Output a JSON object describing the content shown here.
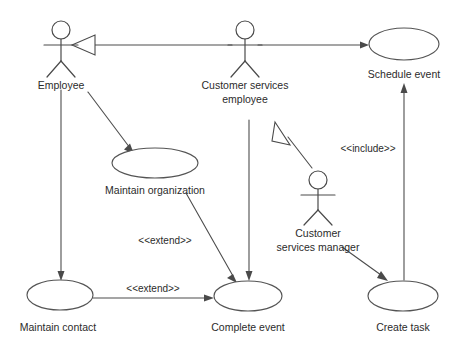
{
  "diagram": {
    "type": "uml-use-case-diagram",
    "background_color": "#ffffff",
    "line_color": "#4a4a4a",
    "text_color": "#2b2b2b",
    "actors": [
      {
        "id": "employee",
        "label": "Employee",
        "x": 61,
        "y": 45
      },
      {
        "id": "customer-services-employee",
        "label_line1": "Customer services",
        "label_line2": "employee",
        "x": 245,
        "y": 45
      },
      {
        "id": "customer-services-manager",
        "label_line1": "Customer",
        "label_line2": "services manager",
        "x": 318,
        "y": 195
      }
    ],
    "use_cases": [
      {
        "id": "schedule-event",
        "label": "Schedule event",
        "cx": 404,
        "cy": 44,
        "rx": 35,
        "ry": 16
      },
      {
        "id": "maintain-organization",
        "label": "Maintain organization",
        "cx": 155,
        "cy": 163,
        "rx": 43,
        "ry": 15
      },
      {
        "id": "maintain-contact",
        "label": "Maintain contact",
        "cx": 60,
        "cy": 295,
        "rx": 33,
        "ry": 15
      },
      {
        "id": "complete-event",
        "label": "Complete event",
        "cx": 248,
        "cy": 296,
        "rx": 34,
        "ry": 15
      },
      {
        "id": "create-task",
        "label": "Create task",
        "cx": 403,
        "cy": 296,
        "rx": 35,
        "ry": 15
      }
    ],
    "relationships": [
      {
        "id": "generalization-cse-to-employee",
        "kind": "generalization",
        "from": "customer-services-employee",
        "to": "employee",
        "label": ""
      },
      {
        "id": "generalization-manager-to-cse",
        "kind": "generalization",
        "from": "customer-services-manager",
        "to": "customer-services-employee",
        "label": ""
      },
      {
        "id": "assoc-cse-to-schedule-event",
        "kind": "association",
        "from": "customer-services-employee",
        "to": "schedule-event",
        "label": ""
      },
      {
        "id": "assoc-employee-to-maintain-organization",
        "kind": "association",
        "from": "employee",
        "to": "maintain-organization",
        "label": ""
      },
      {
        "id": "assoc-employee-to-maintain-contact",
        "kind": "association",
        "from": "employee",
        "to": "maintain-contact",
        "label": ""
      },
      {
        "id": "extend-maintain-organization-to-complete-event",
        "kind": "extend",
        "from": "maintain-organization",
        "to": "complete-event",
        "label": "<<extend>>"
      },
      {
        "id": "extend-maintain-contact-to-complete-event",
        "kind": "extend",
        "from": "maintain-contact",
        "to": "complete-event",
        "label": "<<extend>>"
      },
      {
        "id": "assoc-cse-to-complete-event",
        "kind": "association",
        "from": "customer-services-employee",
        "to": "complete-event",
        "label": ""
      },
      {
        "id": "assoc-manager-to-create-task",
        "kind": "association",
        "from": "customer-services-manager",
        "to": "create-task",
        "label": ""
      },
      {
        "id": "include-create-task-to-schedule-event",
        "kind": "include",
        "from": "create-task",
        "to": "schedule-event",
        "label": "<<include>>"
      }
    ],
    "stereotype_labels": [
      {
        "id": "include-label",
        "text": "<<include>>",
        "x": 368,
        "y": 152
      },
      {
        "id": "extend-label-upper",
        "text": "<<extend>>",
        "x": 165,
        "y": 244
      },
      {
        "id": "extend-label-lower",
        "text": "<<extend>>",
        "x": 153,
        "y": 292
      }
    ]
  }
}
